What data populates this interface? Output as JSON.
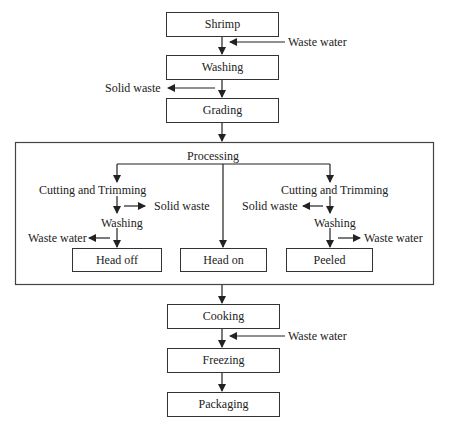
{
  "diagram": {
    "type": "flowchart",
    "main_steps": [
      "Shrimp",
      "Washing",
      "Grading"
    ],
    "processing": {
      "title": "Processing",
      "branches": [
        {
          "steps": [
            "Cutting and Trimming",
            "Washing"
          ],
          "outputs": [
            "Solid waste",
            "Waste water"
          ],
          "result": "Head off"
        },
        {
          "steps": [],
          "outputs": [],
          "result": "Head on"
        },
        {
          "steps": [
            "Cutting and Trimming",
            "Washing"
          ],
          "outputs": [
            "Solid waste",
            "Waste water"
          ],
          "result": "Peeled"
        }
      ]
    },
    "final_steps": [
      "Cooking",
      "Freezing",
      "Packaging"
    ],
    "side_flows": {
      "shrimp_to_washing_input": "Waste water",
      "washing_to_grading_output": "Solid waste",
      "cooking_to_freezing_input": "Waste water"
    }
  }
}
